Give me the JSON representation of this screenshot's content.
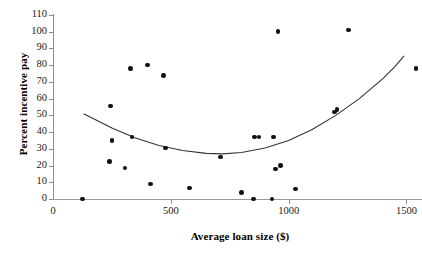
{
  "chart_data": {
    "type": "scatter",
    "title": "",
    "xlabel": "Average loan size ($)",
    "ylabel": "Percent incentive pay",
    "xlim": [
      0,
      1600
    ],
    "ylim": [
      0,
      110
    ],
    "xticks": [
      0,
      500,
      1000,
      1500
    ],
    "yticks": [
      0,
      10,
      20,
      30,
      40,
      50,
      60,
      70,
      80,
      90,
      100,
      110
    ],
    "grid": false,
    "legend": null,
    "points": [
      {
        "x": 125,
        "y": 0
      },
      {
        "x": 240,
        "y": 22.5
      },
      {
        "x": 245,
        "y": 55.5
      },
      {
        "x": 250,
        "y": 35
      },
      {
        "x": 305,
        "y": 18.5
      },
      {
        "x": 330,
        "y": 78
      },
      {
        "x": 335,
        "y": 37
      },
      {
        "x": 400,
        "y": 80
      },
      {
        "x": 415,
        "y": 9
      },
      {
        "x": 470,
        "y": 74
      },
      {
        "x": 478,
        "y": 30.5
      },
      {
        "x": 580,
        "y": 6.5
      },
      {
        "x": 710,
        "y": 25
      },
      {
        "x": 800,
        "y": 4
      },
      {
        "x": 850,
        "y": 0
      },
      {
        "x": 855,
        "y": 37
      },
      {
        "x": 875,
        "y": 37
      },
      {
        "x": 930,
        "y": 0
      },
      {
        "x": 935,
        "y": 37
      },
      {
        "x": 945,
        "y": 18
      },
      {
        "x": 955,
        "y": 100
      },
      {
        "x": 965,
        "y": 20
      },
      {
        "x": 1030,
        "y": 6
      },
      {
        "x": 1195,
        "y": 52
      },
      {
        "x": 1205,
        "y": 53.5
      },
      {
        "x": 1255,
        "y": 101
      },
      {
        "x": 1540,
        "y": 78
      }
    ],
    "fit_curve": {
      "type": "quadratic",
      "label": "",
      "points": [
        {
          "x": 130,
          "y": 51
        },
        {
          "x": 250,
          "y": 42.5
        },
        {
          "x": 350,
          "y": 36.5
        },
        {
          "x": 450,
          "y": 32
        },
        {
          "x": 550,
          "y": 29
        },
        {
          "x": 650,
          "y": 27.3
        },
        {
          "x": 720,
          "y": 27
        },
        {
          "x": 800,
          "y": 27.8
        },
        {
          "x": 900,
          "y": 30.5
        },
        {
          "x": 1000,
          "y": 35
        },
        {
          "x": 1100,
          "y": 41.5
        },
        {
          "x": 1200,
          "y": 50
        },
        {
          "x": 1300,
          "y": 60
        },
        {
          "x": 1400,
          "y": 72
        },
        {
          "x": 1450,
          "y": 79
        },
        {
          "x": 1490,
          "y": 85.5
        }
      ]
    }
  },
  "axes": {
    "y_tick_labels": [
      "110",
      "100",
      "90",
      "80",
      "70",
      "60",
      "50",
      "40",
      "30",
      "20",
      "10",
      "0"
    ],
    "x_tick_labels": [
      "0",
      "500",
      "1000",
      "1500"
    ],
    "x_title": "Average loan size ($)",
    "y_title": "Percent incentive pay"
  },
  "colors": {
    "point": "#111111",
    "axis": "#8c8c8c",
    "curve": "#333333",
    "text": "#000000"
  }
}
